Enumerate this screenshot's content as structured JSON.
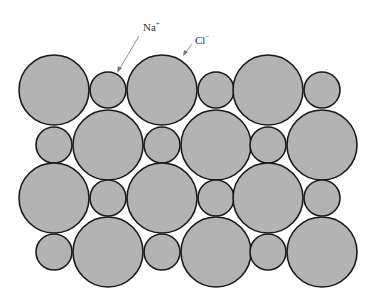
{
  "labels": {
    "na": {
      "text": "Na",
      "charge": "+"
    },
    "cl": {
      "text": "Cl",
      "charge": "−"
    }
  },
  "colors": {
    "ion_fill": "#b3b3b3",
    "ion_stroke": "#1a1a1a",
    "arrow": "#777777"
  },
  "ions": {
    "large_radius": 35,
    "small_radius": 18,
    "rows": [
      {
        "y": 90,
        "items": [
          [
            "Cl",
            54
          ],
          [
            "Na",
            108
          ],
          [
            "Cl",
            162
          ],
          [
            "Na",
            216
          ],
          [
            "Cl",
            268
          ],
          [
            "Na",
            322
          ]
        ]
      },
      {
        "y": 145,
        "items": [
          [
            "Na",
            54
          ],
          [
            "Cl",
            108
          ],
          [
            "Na",
            162
          ],
          [
            "Cl",
            216
          ],
          [
            "Na",
            268
          ],
          [
            "Cl",
            322
          ]
        ]
      },
      {
        "y": 198,
        "items": [
          [
            "Cl",
            54
          ],
          [
            "Na",
            108
          ],
          [
            "Cl",
            162
          ],
          [
            "Na",
            216
          ],
          [
            "Cl",
            268
          ],
          [
            "Na",
            322
          ]
        ]
      },
      {
        "y": 252,
        "items": [
          [
            "Na",
            54
          ],
          [
            "Cl",
            108
          ],
          [
            "Na",
            162
          ],
          [
            "Cl",
            216
          ],
          [
            "Na",
            268
          ],
          [
            "Cl",
            322
          ]
        ]
      }
    ]
  }
}
